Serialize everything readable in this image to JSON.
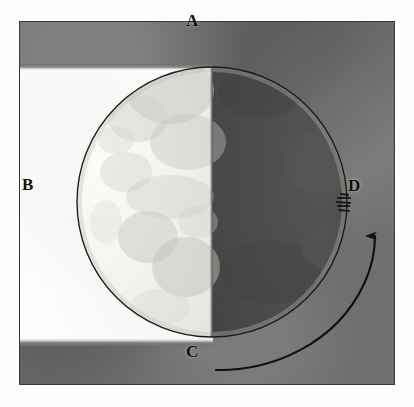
{
  "figure": {
    "background_color": "#6f6f6f",
    "light_field_color": "#fdfdfc",
    "moon_dark_color": "#4b4b4b",
    "moon_light_color": "#f2f2ee",
    "ink_color": "#111111"
  },
  "labels": [
    {
      "id": "A",
      "text": "A",
      "position": "top-center"
    },
    {
      "id": "B",
      "text": "B",
      "position": "left-middle"
    },
    {
      "id": "C",
      "text": "C",
      "position": "bottom-center"
    },
    {
      "id": "D",
      "text": "D",
      "position": "right-middle"
    }
  ],
  "moon": {
    "center_x": 212,
    "center_y": 202,
    "radius": 135,
    "terminator_x": 212,
    "lit_side": "left",
    "dark_side": "right"
  },
  "arrow": {
    "name": "direction-of-motion-arrow",
    "from_label": "C",
    "to_label": "D",
    "direction": "counterclockwise-from-C-to-D",
    "head": "up"
  },
  "marks": {
    "smudge": "ink-smudge-near-d"
  }
}
